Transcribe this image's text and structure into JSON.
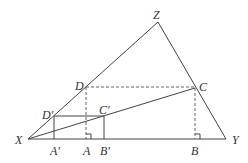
{
  "diagram": {
    "type": "geometry",
    "colors": {
      "line": "#444444",
      "text": "#333333",
      "background": "#ffffff"
    },
    "points": {
      "X": {
        "label": "X",
        "x": 28,
        "y": 139
      },
      "Y": {
        "label": "Y",
        "x": 226,
        "y": 139
      },
      "Z": {
        "label": "Z",
        "x": 158,
        "y": 22
      },
      "A": {
        "label": "A",
        "x": 86,
        "y": 139
      },
      "B": {
        "label": "B",
        "x": 195,
        "y": 139
      },
      "C": {
        "label": "C",
        "x": 195,
        "y": 88
      },
      "D": {
        "label": "D",
        "x": 86,
        "y": 87
      },
      "A_prime": {
        "label": "A'",
        "x": 54,
        "y": 139
      },
      "B_prime": {
        "label": "B'",
        "x": 104,
        "y": 139
      },
      "C_prime": {
        "label": "C'",
        "x": 104,
        "y": 116
      },
      "D_prime": {
        "label": "D'",
        "x": 54,
        "y": 116
      }
    },
    "segments_solid": [
      "XY",
      "XZ",
      "ZY",
      "XC",
      "D'A'",
      "D'C'",
      "C'B'"
    ],
    "segments_dashed": [
      "DA",
      "DC",
      "CB"
    ],
    "right_angle_marks": [
      "A",
      "B"
    ]
  }
}
